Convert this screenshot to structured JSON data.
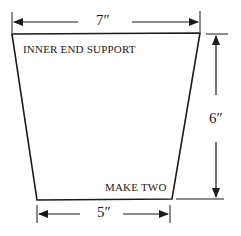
{
  "diagram": {
    "part_label": "INNER END SUPPORT",
    "quantity_note": "MAKE TWO",
    "dimensions": {
      "top_width": "7″",
      "bottom_width": "5″",
      "height": "6″"
    },
    "shape": "trapezoid",
    "line_color": "#1a1a1a"
  }
}
